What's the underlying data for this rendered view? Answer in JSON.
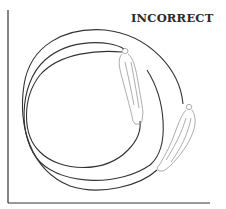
{
  "diagram": {
    "label": "INCORRECT",
    "colors": {
      "background": "#ffffff",
      "line": "#333333",
      "figure": "#8a8a8a"
    },
    "axes": {
      "vertical": {
        "x": 8,
        "y1": 10,
        "y2": 203
      },
      "horizontal": {
        "y": 203,
        "x1": 8,
        "x2": 210
      }
    },
    "paths": [
      {
        "name": "inner-loop",
        "description": "innermost circular path ending at first figure"
      },
      {
        "name": "middle-loop",
        "description": "middle circular path ending at second figure feet"
      },
      {
        "name": "outer-loop",
        "description": "outer circular path starting at second figure head"
      }
    ],
    "figures": [
      {
        "name": "figure-1",
        "position": "upper right of inner loop"
      },
      {
        "name": "figure-2",
        "position": "lower right on outer loop"
      }
    ]
  }
}
